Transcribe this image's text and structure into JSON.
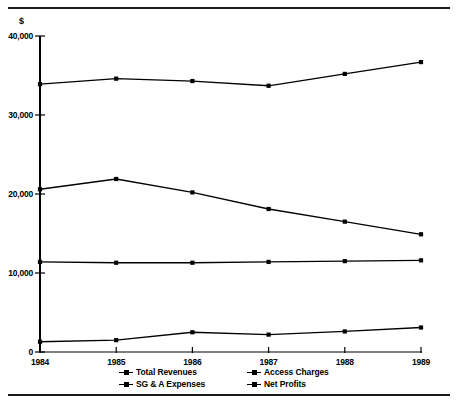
{
  "chart_data": {
    "type": "line",
    "title": "",
    "subtitle": "",
    "xlabel": "",
    "ylabel": "$",
    "currency_symbol": "$",
    "categories": [
      "1984",
      "1985",
      "1986",
      "1987",
      "1988",
      "1989"
    ],
    "x": [
      1984,
      1985,
      1986,
      1987,
      1988,
      1989
    ],
    "ylim": [
      0,
      40000
    ],
    "ytick_values": [
      0,
      10000,
      20000,
      30000,
      40000
    ],
    "ytick_labels": [
      "0",
      "10,000",
      "20,000",
      "30,000",
      "40,000"
    ],
    "xtick_labels": [
      "1984",
      "1985",
      "1986",
      "1987",
      "1988",
      "1989"
    ],
    "grid": false,
    "legend_position": "bottom",
    "marker": "square",
    "line_color": "#000000",
    "series": [
      {
        "name": "Total Revenues",
        "values": [
          33900,
          34600,
          34300,
          33700,
          35200,
          36700
        ]
      },
      {
        "name": "Access Charges",
        "values": [
          20600,
          21900,
          20200,
          18100,
          16500,
          14900
        ]
      },
      {
        "name": "SG & A Expenses",
        "values": [
          11400,
          11300,
          11300,
          11400,
          11500,
          11600
        ]
      },
      {
        "name": "Net Profits",
        "values": [
          1300,
          1500,
          2500,
          2200,
          2600,
          3100
        ]
      }
    ]
  },
  "legend": {
    "row1": [
      {
        "label": "Total Revenues"
      },
      {
        "label": "Access Charges"
      }
    ],
    "row2": [
      {
        "label": "SG & A Expenses"
      },
      {
        "label": "Net Profits"
      }
    ]
  }
}
